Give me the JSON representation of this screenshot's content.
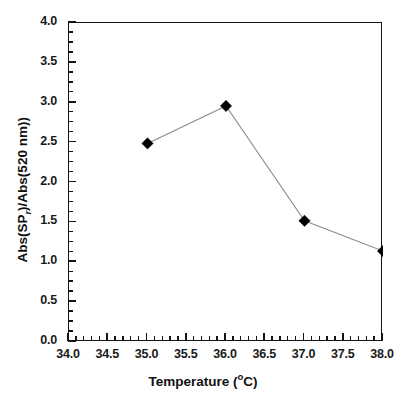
{
  "chart_data": {
    "type": "line",
    "title": "",
    "xlabel": "Temperature (°C)",
    "ylabel": "Abs(SPᵣ)/Abs(520 nm))",
    "ylabel_parts": {
      "prefix": "Abs(SP",
      "subscript": "r",
      "suffix": ")/Abs(520 nm))"
    },
    "xlabel_parts": {
      "prefix": "Temperature (",
      "degree": "o",
      "suffix": "C)"
    },
    "x": [
      35.0,
      36.0,
      37.0,
      38.0
    ],
    "values": [
      2.49,
      2.96,
      1.52,
      1.14
    ],
    "series": [
      {
        "name": "Abs ratio vs temperature",
        "x": [
          35.0,
          36.0,
          37.0,
          38.0
        ],
        "values": [
          2.49,
          2.96,
          1.52,
          1.14
        ]
      }
    ],
    "xlim": [
      34.0,
      38.0
    ],
    "ylim": [
      0.0,
      4.0
    ],
    "xticks": [
      34.0,
      34.5,
      35.0,
      35.5,
      36.0,
      36.5,
      37.0,
      37.5,
      38.0
    ],
    "xtick_labels": [
      "34.0",
      "34.5",
      "35.0",
      "35.5",
      "36.0",
      "36.5",
      "37.0",
      "37.5",
      "38.0"
    ],
    "yticks": [
      0.0,
      0.5,
      1.0,
      1.5,
      2.0,
      2.5,
      3.0,
      3.5,
      4.0
    ],
    "ytick_labels": [
      "0.0",
      "0.5",
      "1.0",
      "1.5",
      "2.0",
      "2.5",
      "3.0",
      "3.5",
      "4.0"
    ],
    "x_minor_step": 0.1,
    "y_minor_step": 0.125,
    "grid": false,
    "legend": false,
    "marker": "filled-diamond",
    "marker_color": "#000000",
    "line_color": "#8c8c8c",
    "frame_color": "#141414",
    "background": "#ffffff"
  }
}
